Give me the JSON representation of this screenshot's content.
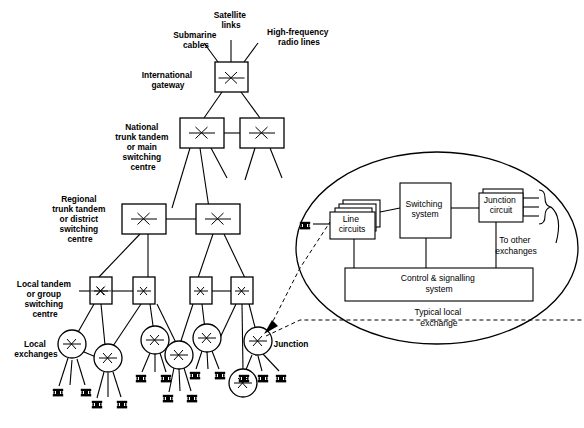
{
  "diagram": {
    "top_links": [
      {
        "id": "submarine",
        "label_line1": "Submarine",
        "label_line2": "cables"
      },
      {
        "id": "satellite",
        "label_line1": "Satellite",
        "label_line2": "links"
      },
      {
        "id": "hf-radio",
        "label_line1": "High-frequency",
        "label_line2": "radio lines"
      }
    ],
    "hierarchy_labels": [
      {
        "id": "international-gateway",
        "lines": [
          "International",
          "gateway"
        ]
      },
      {
        "id": "national-trunk-tandem",
        "lines": [
          "National",
          "trunk tandem",
          "or main",
          "switching",
          "centre"
        ]
      },
      {
        "id": "regional-trunk-tandem",
        "lines": [
          "Regional",
          "trunk tandem",
          "or district",
          "switching",
          "centre"
        ]
      },
      {
        "id": "local-tandem",
        "lines": [
          "Local tandem",
          "or group",
          "switching",
          "centre"
        ]
      },
      {
        "id": "local-exchanges",
        "lines": [
          "Local",
          "exchanges"
        ]
      }
    ],
    "junction_label": "Junction",
    "inset": {
      "line_circuits": {
        "lines": [
          "Line",
          "circuits"
        ]
      },
      "switching_system": {
        "lines": [
          "Switching",
          "system"
        ]
      },
      "junction_circuit": {
        "lines": [
          "Junction",
          "circuit"
        ]
      },
      "control_signalling": {
        "lines": [
          "Control & signalling",
          "system"
        ]
      },
      "to_other_exchanges": {
        "lines": [
          "To other",
          "exchanges"
        ]
      },
      "caption": {
        "lines": [
          "Typical local",
          "exchange"
        ]
      }
    },
    "colors": {
      "stroke": "#000000",
      "fill": "#ffffff"
    }
  }
}
